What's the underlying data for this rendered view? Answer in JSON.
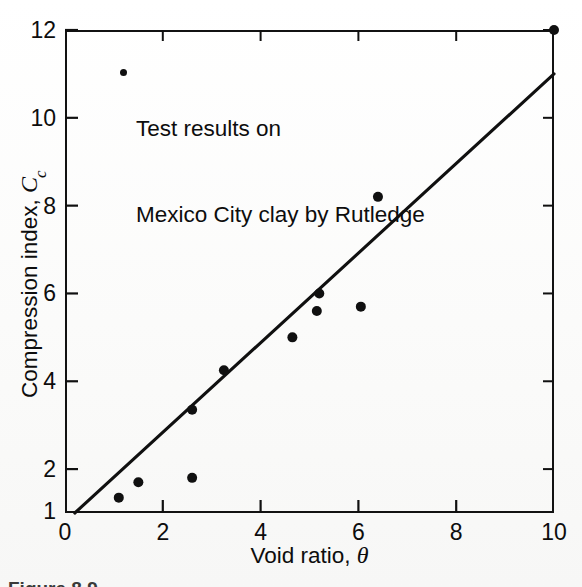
{
  "figure": {
    "background_color": "#fdfdfc",
    "ink_color": "#101010",
    "caption_partial": "Figure 8.9"
  },
  "legend": {
    "marker": "filled-circle",
    "line1": "Test results on",
    "line2": "Mexico City clay by Rutledge"
  },
  "axes": {
    "x_title_text": "Void ratio, ",
    "x_title_symbol": "θ",
    "y_title_text": "Compression index, ",
    "y_title_symbol": "C",
    "y_title_subscript": "c",
    "x_ticks": [
      "0",
      "2",
      "4",
      "6",
      "8",
      "10"
    ],
    "y_ticks": [
      "1",
      "2",
      "4",
      "6",
      "8",
      "10",
      "12"
    ]
  },
  "chart_data": {
    "type": "scatter",
    "title": "",
    "subtitle": "",
    "xlabel": "Void ratio, θ",
    "ylabel": "Compression index, Cc",
    "xlim": [
      0,
      10
    ],
    "ylim": [
      1,
      12
    ],
    "x_ticks": [
      0,
      2,
      4,
      6,
      8,
      10
    ],
    "y_ticks": [
      1,
      2,
      4,
      6,
      8,
      10,
      12
    ],
    "grid": false,
    "legend_position": "upper-left-inside",
    "legend_entries": [
      "Test results on Mexico City clay by Rutledge"
    ],
    "series": [
      {
        "name": "Test results on Mexico City clay by Rutledge",
        "type": "scatter",
        "marker": "filled-circle",
        "marker_color": "#101010",
        "points": [
          {
            "x": 1.1,
            "y": 1.35
          },
          {
            "x": 1.5,
            "y": 1.7
          },
          {
            "x": 2.6,
            "y": 1.8
          },
          {
            "x": 2.6,
            "y": 3.35
          },
          {
            "x": 3.25,
            "y": 4.25
          },
          {
            "x": 4.65,
            "y": 5.0
          },
          {
            "x": 5.15,
            "y": 5.6
          },
          {
            "x": 5.2,
            "y": 6.0
          },
          {
            "x": 6.05,
            "y": 5.7
          },
          {
            "x": 6.4,
            "y": 8.2
          },
          {
            "x": 10.0,
            "y": 12.0
          }
        ]
      },
      {
        "name": "best-fit line",
        "type": "line",
        "line_color": "#101010",
        "points": [
          {
            "x": 0.2,
            "y": 1.0
          },
          {
            "x": 10.0,
            "y": 11.0
          }
        ]
      }
    ]
  }
}
